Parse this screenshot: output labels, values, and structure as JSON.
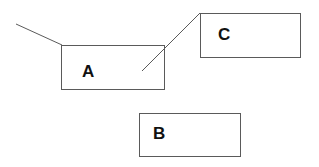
{
  "diagram": {
    "boxes": [
      {
        "id": "A",
        "label": "A",
        "x": 61,
        "y": 45,
        "width": 104,
        "height": 45,
        "label_x": 82,
        "label_y": 63
      },
      {
        "id": "C",
        "label": "C",
        "x": 200,
        "y": 13,
        "width": 101,
        "height": 45,
        "label_x": 218,
        "label_y": 26
      },
      {
        "id": "B",
        "label": "B",
        "x": 139,
        "y": 113,
        "width": 102,
        "height": 44,
        "label_x": 153,
        "label_y": 125
      }
    ],
    "lines": [
      {
        "from": [
          16,
          24
        ],
        "to": [
          62,
          45
        ],
        "note": "free line into A's top-left corner"
      },
      {
        "from": [
          142,
          71
        ],
        "to": [
          200,
          13
        ],
        "note": "line from inside A to C's top-left corner"
      }
    ],
    "colors": {
      "stroke": "#5a5a5a",
      "text": "#111111",
      "background": "#ffffff"
    }
  }
}
